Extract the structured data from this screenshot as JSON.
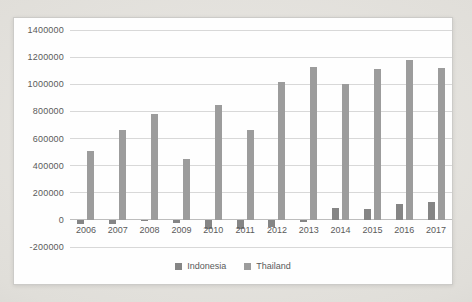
{
  "chart_data": {
    "type": "bar",
    "title": "",
    "xlabel": "",
    "ylabel": "",
    "categories": [
      "2006",
      "2007",
      "2008",
      "2009",
      "2010",
      "2011",
      "2012",
      "2013",
      "2014",
      "2015",
      "2016",
      "2017"
    ],
    "series": [
      {
        "name": "Indonesia",
        "color": "#858585",
        "values": [
          -30000,
          -30000,
          -10000,
          -25000,
          -70000,
          -65000,
          -50000,
          -15000,
          90000,
          80000,
          115000,
          135000
        ]
      },
      {
        "name": "Thailand",
        "color": "#9c9c9c",
        "values": [
          510000,
          660000,
          780000,
          450000,
          850000,
          665000,
          1020000,
          1130000,
          1000000,
          1110000,
          1180000,
          1120000
        ]
      }
    ],
    "ylim": [
      -200000,
      1400000
    ],
    "ytick_interval": 200000,
    "ytick_labels": [
      "-200000",
      "0",
      "200000",
      "400000",
      "600000",
      "800000",
      "1000000",
      "1200000",
      "1400000"
    ],
    "grid": true,
    "legend_position": "bottom",
    "colors": {
      "grid_line": "#d8d8d8",
      "zero_line": "#bdbdbd",
      "axis_text": "#5a5a5a",
      "chart_background": "#fefefe",
      "chart_border": "#cccbc8"
    }
  }
}
